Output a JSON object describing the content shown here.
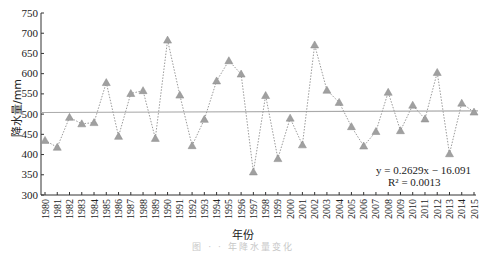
{
  "chart_data": {
    "type": "line",
    "title": "",
    "xlabel": "年份",
    "ylabel": "降水量/mm",
    "ylim": [
      300,
      750
    ],
    "yticks": [
      300,
      350,
      400,
      450,
      500,
      550,
      600,
      650,
      700,
      750
    ],
    "grid": false,
    "legend": null,
    "categories": [
      "1980",
      "1981",
      "1982",
      "1983",
      "1984",
      "1985",
      "1986",
      "1987",
      "1988",
      "1989",
      "1990",
      "1991",
      "1992",
      "1993",
      "1994",
      "1995",
      "1996",
      "1997",
      "1998",
      "1999",
      "2000",
      "2001",
      "2002",
      "2003",
      "2004",
      "2005",
      "2006",
      "2007",
      "2008",
      "2009",
      "2010",
      "2011",
      "2012",
      "2013",
      "2014",
      "2015"
    ],
    "series": [
      {
        "name": "降水量",
        "style": "dotted line with triangle markers",
        "color": "#999999",
        "values": [
          435,
          418,
          492,
          476,
          479,
          578,
          445,
          551,
          558,
          440,
          683,
          547,
          422,
          487,
          582,
          632,
          599,
          357,
          546,
          390,
          490,
          424,
          671,
          559,
          529,
          469,
          421,
          457,
          554,
          459,
          522,
          488,
          603,
          402,
          527,
          505
        ]
      },
      {
        "name": "线性趋势",
        "style": "solid line",
        "color": "#aaaaaa",
        "values_endpoints": [
          504,
          508
        ]
      }
    ],
    "annotations": [
      "y = 0.2629x − 16.091",
      "R² = 0.0013"
    ]
  },
  "labels": {
    "xlabel": "年份",
    "ylabel": "降水量/mm",
    "eq1": "y = 0.2629x − 16.091",
    "eq2": "R² = 0.0013",
    "caption": "图  ·  ·  年降水量变化"
  }
}
